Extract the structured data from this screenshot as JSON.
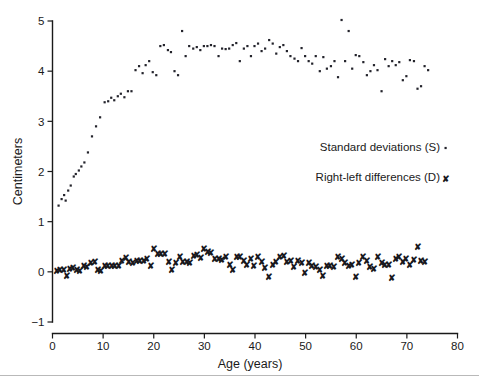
{
  "chart_data": {
    "type": "scatter",
    "title": "",
    "xlabel": "Age (years)",
    "ylabel": "Centimeters",
    "xlim": [
      0,
      80
    ],
    "ylim": [
      -1,
      5
    ],
    "xticks": [
      0,
      10,
      20,
      30,
      40,
      50,
      60,
      70,
      80
    ],
    "yticks": [
      -1,
      0,
      1,
      2,
      3,
      4,
      5
    ],
    "grid": false,
    "legend_position": "center-right",
    "series": [
      {
        "name": "Standard deviations (S)",
        "marker": "dot",
        "points": [
          [
            1.2,
            1.32
          ],
          [
            1.8,
            1.45
          ],
          [
            2.3,
            1.53
          ],
          [
            2.6,
            1.42
          ],
          [
            3.1,
            1.62
          ],
          [
            3.6,
            1.72
          ],
          [
            4.2,
            1.9
          ],
          [
            4.6,
            1.95
          ],
          [
            5.2,
            2.02
          ],
          [
            5.7,
            2.1
          ],
          [
            6.3,
            2.18
          ],
          [
            7.0,
            2.38
          ],
          [
            7.8,
            2.7
          ],
          [
            8.6,
            2.9
          ],
          [
            9.4,
            3.08
          ],
          [
            10.3,
            3.38
          ],
          [
            11.0,
            3.4
          ],
          [
            11.6,
            3.47
          ],
          [
            12.2,
            3.42
          ],
          [
            12.9,
            3.5
          ],
          [
            13.5,
            3.55
          ],
          [
            14.2,
            3.48
          ],
          [
            14.9,
            3.6
          ],
          [
            15.6,
            3.6
          ],
          [
            16.4,
            4.02
          ],
          [
            17.1,
            4.1
          ],
          [
            17.8,
            3.96
          ],
          [
            18.4,
            4.12
          ],
          [
            19.1,
            4.2
          ],
          [
            19.8,
            3.98
          ],
          [
            20.5,
            3.92
          ],
          [
            21.3,
            4.5
          ],
          [
            22.0,
            4.52
          ],
          [
            22.8,
            4.42
          ],
          [
            23.4,
            4.38
          ],
          [
            24.1,
            4.0
          ],
          [
            24.8,
            3.92
          ],
          [
            25.6,
            4.8
          ],
          [
            26.3,
            4.3
          ],
          [
            27.0,
            4.5
          ],
          [
            27.8,
            4.45
          ],
          [
            28.5,
            4.48
          ],
          [
            29.2,
            4.42
          ],
          [
            29.9,
            4.5
          ],
          [
            30.6,
            4.5
          ],
          [
            31.3,
            4.52
          ],
          [
            32.0,
            4.5
          ],
          [
            32.8,
            4.3
          ],
          [
            33.5,
            4.45
          ],
          [
            34.2,
            4.44
          ],
          [
            34.9,
            4.45
          ],
          [
            35.6,
            4.52
          ],
          [
            36.3,
            4.56
          ],
          [
            37.0,
            4.2
          ],
          [
            37.8,
            4.45
          ],
          [
            38.5,
            4.5
          ],
          [
            39.2,
            4.3
          ],
          [
            39.9,
            4.5
          ],
          [
            40.6,
            4.55
          ],
          [
            41.3,
            4.4
          ],
          [
            42.0,
            4.45
          ],
          [
            42.8,
            4.62
          ],
          [
            43.5,
            4.55
          ],
          [
            44.2,
            4.35
          ],
          [
            44.9,
            4.48
          ],
          [
            45.6,
            4.52
          ],
          [
            46.3,
            4.4
          ],
          [
            47.0,
            4.3
          ],
          [
            47.8,
            4.25
          ],
          [
            48.5,
            4.2
          ],
          [
            49.2,
            4.46
          ],
          [
            49.9,
            4.3
          ],
          [
            50.6,
            4.2
          ],
          [
            51.3,
            4.15
          ],
          [
            52.0,
            4.3
          ],
          [
            52.8,
            4.0
          ],
          [
            53.5,
            4.28
          ],
          [
            54.2,
            4.05
          ],
          [
            55.0,
            4.1
          ],
          [
            55.7,
            4.2
          ],
          [
            56.4,
            3.88
          ],
          [
            57.1,
            5.02
          ],
          [
            57.8,
            4.2
          ],
          [
            58.5,
            4.8
          ],
          [
            59.2,
            4.05
          ],
          [
            59.9,
            4.32
          ],
          [
            60.6,
            4.3
          ],
          [
            61.4,
            4.18
          ],
          [
            62.1,
            3.92
          ],
          [
            62.8,
            4.0
          ],
          [
            63.5,
            4.12
          ],
          [
            64.2,
            4.02
          ],
          [
            65.0,
            3.6
          ],
          [
            65.7,
            4.24
          ],
          [
            66.4,
            4.1
          ],
          [
            67.1,
            4.2
          ],
          [
            67.8,
            4.12
          ],
          [
            68.5,
            4.18
          ],
          [
            69.2,
            3.82
          ],
          [
            69.9,
            3.9
          ],
          [
            70.6,
            4.22
          ],
          [
            71.4,
            4.2
          ],
          [
            72.1,
            3.65
          ],
          [
            72.8,
            3.7
          ],
          [
            73.5,
            4.1
          ],
          [
            74.2,
            4.02
          ]
        ]
      },
      {
        "name": "Right-left differences (D)",
        "marker": "x",
        "points": [
          [
            0.8,
            0.02
          ],
          [
            1.5,
            0.05
          ],
          [
            2.2,
            0.04
          ],
          [
            2.8,
            -0.08
          ],
          [
            3.4,
            0.06
          ],
          [
            4.1,
            0.08
          ],
          [
            4.8,
            0.05
          ],
          [
            5.5,
            0.02
          ],
          [
            6.2,
            0.12
          ],
          [
            6.9,
            0.1
          ],
          [
            7.6,
            0.18
          ],
          [
            8.3,
            0.2
          ],
          [
            8.9,
            0.05
          ],
          [
            9.6,
            0.02
          ],
          [
            10.3,
            0.12
          ],
          [
            11.0,
            0.12
          ],
          [
            11.7,
            0.12
          ],
          [
            12.4,
            0.12
          ],
          [
            13.1,
            0.12
          ],
          [
            13.8,
            0.22
          ],
          [
            14.5,
            0.28
          ],
          [
            15.2,
            0.2
          ],
          [
            15.9,
            0.18
          ],
          [
            16.6,
            0.22
          ],
          [
            17.3,
            0.22
          ],
          [
            18.0,
            0.22
          ],
          [
            18.7,
            0.26
          ],
          [
            19.4,
            0.12
          ],
          [
            20.1,
            0.45
          ],
          [
            20.8,
            0.35
          ],
          [
            21.5,
            0.36
          ],
          [
            22.2,
            0.35
          ],
          [
            23.0,
            0.2
          ],
          [
            23.7,
            0.05
          ],
          [
            24.4,
            0.18
          ],
          [
            25.1,
            0.3
          ],
          [
            25.8,
            0.2
          ],
          [
            26.5,
            0.2
          ],
          [
            27.2,
            0.18
          ],
          [
            27.9,
            0.32
          ],
          [
            28.6,
            0.34
          ],
          [
            29.3,
            0.28
          ],
          [
            30.0,
            0.45
          ],
          [
            30.7,
            0.4
          ],
          [
            31.4,
            0.38
          ],
          [
            32.1,
            0.26
          ],
          [
            32.8,
            0.25
          ],
          [
            33.5,
            0.24
          ],
          [
            34.2,
            0.3
          ],
          [
            35.0,
            0.14
          ],
          [
            35.7,
            0.05
          ],
          [
            36.4,
            0.3
          ],
          [
            37.1,
            0.3
          ],
          [
            37.8,
            0.22
          ],
          [
            38.5,
            0.15
          ],
          [
            39.2,
            0.25
          ],
          [
            39.9,
            0.12
          ],
          [
            40.6,
            0.3
          ],
          [
            41.3,
            0.2
          ],
          [
            42.0,
            0.08
          ],
          [
            42.8,
            -0.1
          ],
          [
            43.5,
            0.15
          ],
          [
            44.2,
            0.2
          ],
          [
            45.0,
            0.3
          ],
          [
            45.7,
            0.32
          ],
          [
            46.4,
            0.2
          ],
          [
            47.1,
            0.22
          ],
          [
            47.8,
            0.1
          ],
          [
            48.5,
            0.22
          ],
          [
            49.2,
            0.18
          ],
          [
            49.9,
            -0.02
          ],
          [
            50.6,
            0.18
          ],
          [
            51.3,
            0.12
          ],
          [
            52.0,
            0.1
          ],
          [
            52.8,
            0.05
          ],
          [
            53.5,
            -0.08
          ],
          [
            54.2,
            0.12
          ],
          [
            54.9,
            0.12
          ],
          [
            55.6,
            0.1
          ],
          [
            56.4,
            0.3
          ],
          [
            57.1,
            0.25
          ],
          [
            57.8,
            0.18
          ],
          [
            58.5,
            0.12
          ],
          [
            59.2,
            0.15
          ],
          [
            59.9,
            -0.1
          ],
          [
            60.6,
            0.18
          ],
          [
            61.4,
            0.3
          ],
          [
            62.1,
            0.22
          ],
          [
            62.8,
            0.1
          ],
          [
            63.5,
            0.06
          ],
          [
            64.2,
            0.3
          ],
          [
            65.0,
            0.18
          ],
          [
            65.7,
            0.15
          ],
          [
            66.4,
            0.15
          ],
          [
            67.1,
            -0.12
          ],
          [
            67.8,
            0.25
          ],
          [
            68.5,
            0.3
          ],
          [
            69.2,
            0.2
          ],
          [
            69.9,
            0.25
          ],
          [
            70.6,
            0.15
          ],
          [
            71.4,
            0.24
          ],
          [
            72.1,
            0.5
          ],
          [
            72.8,
            0.22
          ],
          [
            73.5,
            0.2
          ]
        ]
      }
    ]
  },
  "legend": {
    "items": [
      {
        "label": "Standard deviations (S)",
        "marker": "·"
      },
      {
        "label": "Right-left differences (D)",
        "marker": "✗"
      }
    ]
  },
  "axes": {
    "y_title": "Centimeters",
    "x_title": "Age (years)",
    "x_tick_labels": [
      "0",
      "10",
      "20",
      "30",
      "40",
      "50",
      "60",
      "70",
      "80"
    ],
    "y_tick_labels": [
      "5",
      "4",
      "3",
      "2",
      "1",
      "0",
      "−1"
    ]
  }
}
